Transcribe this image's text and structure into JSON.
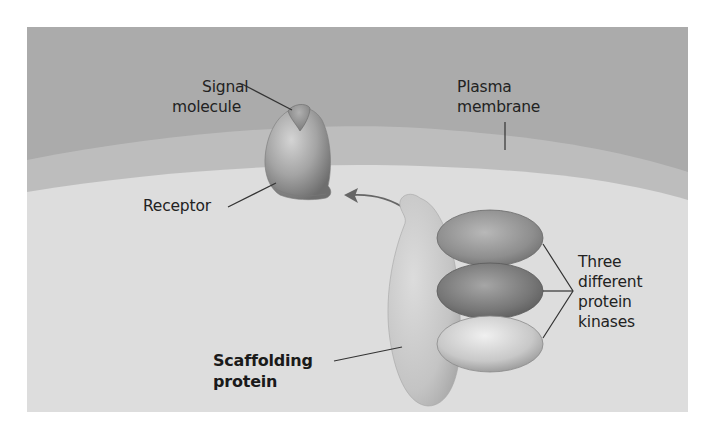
{
  "diagram": {
    "colors": {
      "page_background": "#ffffff",
      "extracellular": "#a9a9a9",
      "membrane_band": "#bcbcbc",
      "cytoplasm": "#dcdcdc",
      "receptor": "#9a9a9a",
      "signal_molecule": "#8a8a8a",
      "scaffold": "#c4c4c4",
      "kinase_top": "#8f8f8f",
      "kinase_middle": "#7a7a7a",
      "kinase_bottom": "#c9c9c9",
      "label_text": "#222222",
      "leader_line": "#333333",
      "arrow": "#666666"
    },
    "labels": {
      "signal_molecule": [
        "Signal",
        "molecule"
      ],
      "plasma_membrane": [
        "Plasma",
        "membrane"
      ],
      "receptor": "Receptor",
      "kinases": [
        "Three",
        "different",
        "protein",
        "kinases"
      ],
      "scaffolding_protein": [
        "Scaffolding",
        "protein"
      ]
    },
    "components": [
      {
        "name": "signal molecule",
        "shape": "triangle-cap"
      },
      {
        "name": "receptor",
        "shape": "egg"
      },
      {
        "name": "plasma membrane",
        "shape": "curved band"
      },
      {
        "name": "scaffolding protein",
        "shape": "elongated blob"
      },
      {
        "name": "protein kinase 1",
        "shape": "ellipse"
      },
      {
        "name": "protein kinase 2",
        "shape": "ellipse"
      },
      {
        "name": "protein kinase 3",
        "shape": "ellipse"
      }
    ],
    "arrow": {
      "from": "scaffolding protein",
      "to": "receptor",
      "style": "curved"
    }
  }
}
